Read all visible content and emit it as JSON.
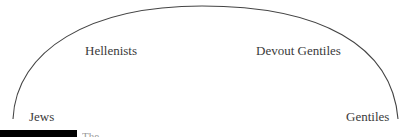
{
  "diagram": {
    "type": "arc",
    "labels": {
      "left_end": "Jews",
      "left_upper": "Hellenists",
      "right_upper": "Devout Gentiles",
      "right_end": "Gentiles"
    },
    "caption": {
      "bar_color": "#000000",
      "text": "The"
    },
    "colors": {
      "line": "#444444",
      "text": "#3a3a3a"
    }
  }
}
